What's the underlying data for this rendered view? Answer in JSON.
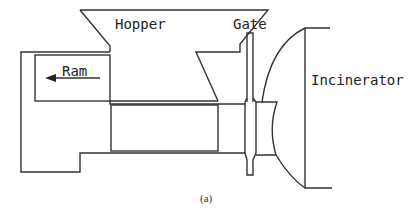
{
  "figure": {
    "caption": "(a)",
    "labels": {
      "hopper": "Hopper",
      "gate": "Gate",
      "ram": "Ram",
      "incinerator": "Incinerator"
    },
    "colors": {
      "stroke": "#333333",
      "text": "#222222",
      "background": "#ffffff"
    },
    "components": [
      {
        "name": "Hopper",
        "description": "Funnel-shaped hopper feeding the ram chamber"
      },
      {
        "name": "Ram",
        "description": "Ram piston with leftward arrow indicating motion"
      },
      {
        "name": "Gate",
        "description": "Vertical sliding gate between feed chamber and incinerator"
      },
      {
        "name": "Incinerator",
        "description": "Incinerator chamber on the right with curved wall"
      }
    ]
  }
}
